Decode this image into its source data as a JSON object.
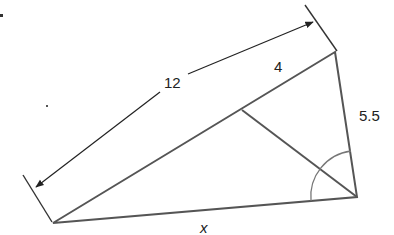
{
  "figure": {
    "type": "triangle-with-angle-bisector",
    "vertices": {
      "top": {
        "x": 335,
        "y": 52
      },
      "bottom_left": {
        "x": 53,
        "y": 223
      },
      "bottom_right": {
        "x": 357,
        "y": 197
      },
      "bisector_foot": {
        "x": 242,
        "y": 110
      }
    },
    "labels": {
      "long_side_total": "12",
      "upper_segment": "4",
      "right_side": "5.5",
      "base": "x"
    },
    "colors": {
      "line": "#555555",
      "dimension": "#222222",
      "arc": "#777777",
      "text": "#222222"
    },
    "angle_mark": "bisected angle at bottom-right vertex"
  }
}
